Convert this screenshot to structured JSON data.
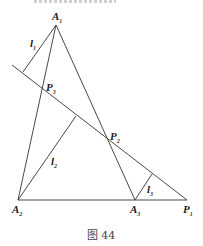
{
  "top_text_cut": "",
  "caption": "图 44",
  "points": {
    "A1": {
      "label": "A",
      "sub": "1",
      "x": 56,
      "y": 25
    },
    "A2": {
      "label": "A",
      "sub": "2",
      "x": 18,
      "y": 200
    },
    "A3": {
      "label": "A",
      "sub": "3",
      "x": 135,
      "y": 200
    },
    "P1": {
      "label": "P",
      "sub": "1",
      "x": 187,
      "y": 200
    },
    "P2": {
      "label": "P",
      "sub": "2",
      "x": 106,
      "y": 141
    },
    "P3": {
      "label": "P",
      "sub": "3",
      "x": 43,
      "y": 89
    }
  },
  "lines": {
    "l1": {
      "label": "l",
      "sub": "1"
    },
    "l2": {
      "label": "l",
      "sub": "2"
    },
    "l3": {
      "label": "l",
      "sub": "3"
    }
  }
}
